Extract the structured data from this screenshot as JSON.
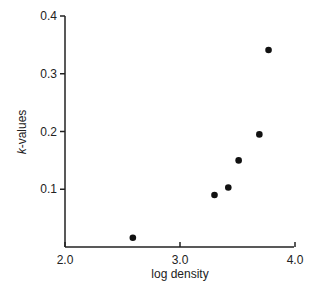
{
  "chart_data": {
    "type": "scatter",
    "title": "",
    "xlabel": "log density",
    "ylabel": "k-values",
    "xlim": [
      2.0,
      4.0
    ],
    "ylim": [
      0,
      0.4
    ],
    "x_ticks": [
      "2.0",
      "3.0",
      "4.0"
    ],
    "y_ticks": [
      "0.1",
      "0.2",
      "0.3",
      "0.4"
    ],
    "grid": false,
    "legend": null,
    "series": [
      {
        "name": "k-values",
        "points": [
          {
            "x": 2.59,
            "y": 0.016
          },
          {
            "x": 3.3,
            "y": 0.09
          },
          {
            "x": 3.42,
            "y": 0.103
          },
          {
            "x": 3.51,
            "y": 0.15
          },
          {
            "x": 3.69,
            "y": 0.195
          },
          {
            "x": 3.77,
            "y": 0.341
          }
        ]
      }
    ]
  },
  "colors": {
    "axis": "#222222",
    "marker": "#111111"
  }
}
